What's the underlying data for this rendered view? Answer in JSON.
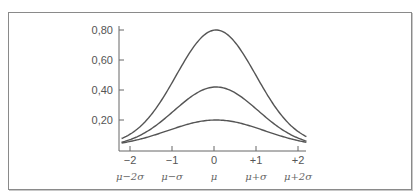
{
  "chart_data": {
    "type": "line",
    "title": "",
    "xlabel": "",
    "ylabel": "",
    "xlim": [
      -2.2,
      2.2
    ],
    "ylim": [
      0,
      0.8
    ],
    "grid": false,
    "legend": null,
    "y_ticks": [
      {
        "value": 0.8,
        "label": "0,80"
      },
      {
        "value": 0.6,
        "label": "0,60"
      },
      {
        "value": 0.4,
        "label": "0,40"
      },
      {
        "value": 0.2,
        "label": "0,20"
      }
    ],
    "x_ticks": [
      {
        "value": -2,
        "label": "−2",
        "sublabel": "μ−2σ"
      },
      {
        "value": -1,
        "label": "−1",
        "sublabel": "μ−σ"
      },
      {
        "value": 0,
        "label": "0",
        "sublabel": "μ"
      },
      {
        "value": 1,
        "label": "+1",
        "sublabel": "μ+σ"
      },
      {
        "value": 2,
        "label": "+2",
        "sublabel": "μ+2σ"
      }
    ],
    "series": [
      {
        "name": "curve-tall",
        "peak": 0.8,
        "center": 0.05,
        "width": 0.95,
        "floor": 0.03,
        "x_range": [
          -2.2,
          2.2
        ]
      },
      {
        "name": "curve-medium",
        "peak": 0.42,
        "center": 0.05,
        "width": 1.0,
        "floor": 0.02,
        "x_range": [
          -2.2,
          2.2
        ]
      },
      {
        "name": "curve-low",
        "peak": 0.2,
        "center": 0.05,
        "width": 1.15,
        "floor": 0.02,
        "x_range": [
          -2.2,
          2.2
        ]
      }
    ],
    "line_color": "#555555"
  }
}
